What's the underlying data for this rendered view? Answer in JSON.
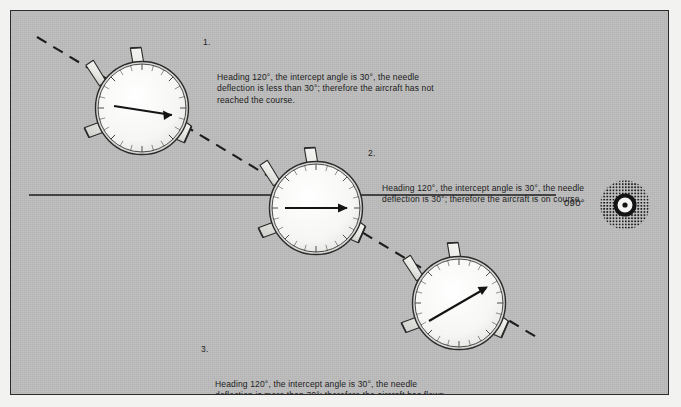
{
  "figure": {
    "background_color": "#bcbcbc",
    "frame_border_color": "#2b2b2b",
    "ink_color": "#1c1c1c"
  },
  "course": {
    "label": "090°",
    "line_name": "inbound-course-line",
    "station_name": "vor-station"
  },
  "intercept": {
    "track_name": "intercept-track-dashed",
    "heading": "120°",
    "intercept_angle": "30°"
  },
  "notes": [
    {
      "number": "1.",
      "text": "Heading 120°, the intercept angle is 30°, the needle deflection is less than 30°; therefore the aircraft has not reached the course."
    },
    {
      "number": "2.",
      "text": "Heading 120°, the intercept angle is 30°, the needle deflection is 30°; therefore the aircraft is on course."
    },
    {
      "number": "3.",
      "text": "Heading 120°, the intercept angle is 30°, the needle deflection is more than 30°; therefore the aircraft has flown through the course."
    }
  ],
  "aircraft": [
    {
      "position_label": "1",
      "name": "aircraft-position-1",
      "instrument_name": "rmi-dial-1",
      "needle_name": "bearing-needle-1",
      "needle_deflection": "less than 30°"
    },
    {
      "position_label": "2",
      "name": "aircraft-position-2",
      "instrument_name": "rmi-dial-2",
      "needle_name": "bearing-needle-2",
      "needle_deflection": "30°"
    },
    {
      "position_label": "3",
      "name": "aircraft-position-3",
      "instrument_name": "rmi-dial-3",
      "needle_name": "bearing-needle-3",
      "needle_deflection": "more than 30°"
    }
  ]
}
